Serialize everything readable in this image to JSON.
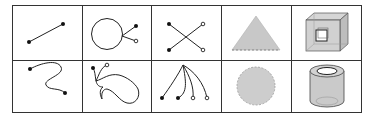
{
  "figure": {
    "layout": "grid",
    "rows": 2,
    "columns": 5,
    "border_color": "#333333",
    "fill_gray": "#c8c8c8",
    "cells": [
      {
        "row": 1,
        "col": 1,
        "shape": "line-segment",
        "description": "straight segment with two filled endpoints"
      },
      {
        "row": 1,
        "col": 2,
        "shape": "circle-with-stems",
        "description": "circle with two stems ending in filled and open endpoints"
      },
      {
        "row": 1,
        "col": 3,
        "shape": "crossing-lines",
        "description": "two crossing segments, filled endpoints left, open endpoints right"
      },
      {
        "row": 1,
        "col": 4,
        "shape": "triangle",
        "description": "gray filled triangle with dashed base"
      },
      {
        "row": 1,
        "col": 5,
        "shape": "cube-with-hole",
        "description": "translucent gray cube with inner square hole"
      },
      {
        "row": 2,
        "col": 1,
        "shape": "curve",
        "description": "S-shaped curve with two filled endpoints"
      },
      {
        "row": 2,
        "col": 2,
        "shape": "blob-with-stems",
        "description": "closed wavy region with two stems (filled and open endpoints)"
      },
      {
        "row": 2,
        "col": 3,
        "shape": "curve-fan",
        "description": "four curves from one apex, two filled and two open endpoints"
      },
      {
        "row": 2,
        "col": 4,
        "shape": "disk",
        "description": "gray filled disk with dashed outline"
      },
      {
        "row": 2,
        "col": 5,
        "shape": "cylinder",
        "description": "translucent gray hollow cylinder"
      }
    ]
  }
}
